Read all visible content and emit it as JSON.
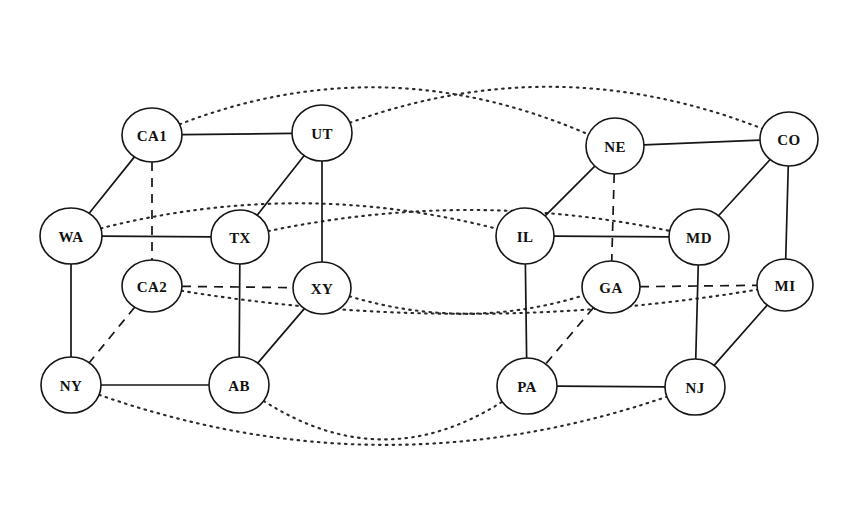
{
  "diagram": {
    "canvas": {
      "width": 850,
      "height": 527,
      "background": "#ffffff"
    },
    "style": {
      "node_fill": "#ffffff",
      "node_stroke": "#161616",
      "edge_color": "#161616",
      "overlay_color": "#2a2a2a",
      "node_radius_x": 29,
      "node_radius_y": 26
    },
    "legend": {
      "solid": "physical link",
      "dashed": "secondary link",
      "dotted": "overlay / long-haul link"
    },
    "nodes": [
      {
        "id": "CA1",
        "label": "CA1",
        "x": 152,
        "y": 135,
        "rx": 30,
        "ry": 27
      },
      {
        "id": "UT",
        "label": "UT",
        "x": 322,
        "y": 133,
        "rx": 30,
        "ry": 28
      },
      {
        "id": "NE",
        "label": "NE",
        "x": 615,
        "y": 146,
        "rx": 29,
        "ry": 28
      },
      {
        "id": "CO",
        "label": "CO",
        "x": 789,
        "y": 139,
        "rx": 29,
        "ry": 27
      },
      {
        "id": "WA",
        "label": "WA",
        "x": 71,
        "y": 236,
        "rx": 31,
        "ry": 28
      },
      {
        "id": "TX",
        "label": "TX",
        "x": 240,
        "y": 237,
        "rx": 29,
        "ry": 27
      },
      {
        "id": "IL",
        "label": "IL",
        "x": 525,
        "y": 236,
        "rx": 29,
        "ry": 28
      },
      {
        "id": "MD",
        "label": "MD",
        "x": 699,
        "y": 237,
        "rx": 30,
        "ry": 28
      },
      {
        "id": "CA2",
        "label": "CA2",
        "x": 152,
        "y": 286,
        "rx": 30,
        "ry": 26
      },
      {
        "id": "XY",
        "label": "XY",
        "x": 322,
        "y": 288,
        "rx": 29,
        "ry": 26
      },
      {
        "id": "GA",
        "label": "GA",
        "x": 611,
        "y": 287,
        "rx": 29,
        "ry": 26
      },
      {
        "id": "MI",
        "label": "MI",
        "x": 785,
        "y": 285,
        "rx": 28,
        "ry": 26
      },
      {
        "id": "NY",
        "label": "NY",
        "x": 71,
        "y": 385,
        "rx": 30,
        "ry": 28
      },
      {
        "id": "AB",
        "label": "AB",
        "x": 239,
        "y": 385,
        "rx": 30,
        "ry": 28
      },
      {
        "id": "PA",
        "label": "PA",
        "x": 527,
        "y": 386,
        "rx": 30,
        "ry": 28
      },
      {
        "id": "NJ",
        "label": "NJ",
        "x": 695,
        "y": 387,
        "rx": 30,
        "ry": 28
      }
    ],
    "edges_solid": [
      {
        "from": "CA1",
        "to": "UT"
      },
      {
        "from": "CA1",
        "to": "WA"
      },
      {
        "from": "UT",
        "to": "TX"
      },
      {
        "from": "UT",
        "to": "XY"
      },
      {
        "from": "WA",
        "to": "TX"
      },
      {
        "from": "WA",
        "to": "NY"
      },
      {
        "from": "TX",
        "to": "AB"
      },
      {
        "from": "XY",
        "to": "AB"
      },
      {
        "from": "NY",
        "to": "AB"
      },
      {
        "from": "NE",
        "to": "CO"
      },
      {
        "from": "NE",
        "to": "IL"
      },
      {
        "from": "CO",
        "to": "MD"
      },
      {
        "from": "CO",
        "to": "MI"
      },
      {
        "from": "IL",
        "to": "MD"
      },
      {
        "from": "IL",
        "to": "PA"
      },
      {
        "from": "MD",
        "to": "NJ"
      },
      {
        "from": "MI",
        "to": "NJ"
      },
      {
        "from": "PA",
        "to": "NJ"
      }
    ],
    "edges_dashed": [
      {
        "from": "CA1",
        "to": "CA2"
      },
      {
        "from": "CA2",
        "to": "XY"
      },
      {
        "from": "CA2",
        "to": "NY"
      },
      {
        "from": "NE",
        "to": "GA"
      },
      {
        "from": "GA",
        "to": "MI"
      },
      {
        "from": "GA",
        "to": "PA"
      }
    ],
    "edges_dotted": [
      {
        "from": "CA1",
        "to": "NE",
        "bow": -95,
        "note": "top outer arc"
      },
      {
        "from": "UT",
        "to": "CO",
        "bow": -88,
        "note": "top inner arc"
      },
      {
        "from": "WA",
        "to": "IL",
        "bow": -58,
        "note": "upper middle arc"
      },
      {
        "from": "TX",
        "to": "MD",
        "bow": -48,
        "note": "lower middle arc"
      },
      {
        "from": "CA2",
        "to": "MI",
        "bow": 52,
        "note": "lower band long arc"
      },
      {
        "from": "XY",
        "to": "GA",
        "bow": 44,
        "note": "lower band short arc"
      },
      {
        "from": "NY",
        "to": "NJ",
        "bow": 108,
        "note": "bottom outer arc"
      },
      {
        "from": "AB",
        "to": "PA",
        "bow": 92,
        "note": "bottom inner arc"
      }
    ]
  }
}
